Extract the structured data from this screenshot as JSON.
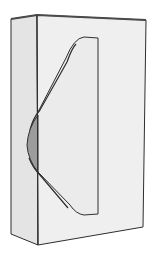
{
  "figure": {
    "colors": {
      "background": "#ffffff",
      "left_face": "#e4e4e4",
      "front_face": "#efefef",
      "cutout_panel": "#ebebeb",
      "bulge": "#9c9c9c",
      "stroke": "#2e2e2e",
      "top_edge": "#555555"
    }
  }
}
